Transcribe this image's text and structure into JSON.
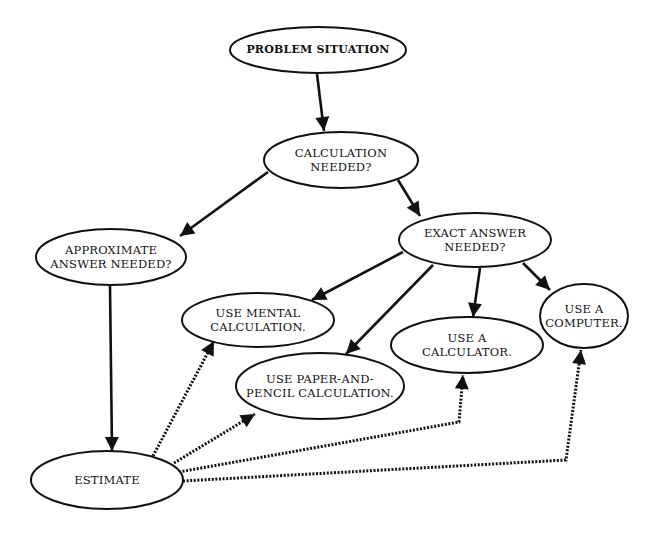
{
  "diagram": {
    "type": "flowchart",
    "nodes": [
      {
        "id": "problem",
        "lines": [
          "PROBLEM  SITUATION"
        ],
        "cx": 318,
        "cy": 50,
        "rx": 88,
        "ry": 23
      },
      {
        "id": "calc_needed",
        "lines": [
          "CALCULATION",
          "NEEDED?"
        ],
        "cx": 341,
        "cy": 160,
        "rx": 77,
        "ry": 28
      },
      {
        "id": "approx",
        "lines": [
          "APPROXIMATE",
          "ANSWER NEEDED?"
        ],
        "cx": 111,
        "cy": 257,
        "rx": 75,
        "ry": 28
      },
      {
        "id": "exact",
        "lines": [
          "EXACT ANSWER",
          "NEEDED?"
        ],
        "cx": 475,
        "cy": 240,
        "rx": 76,
        "ry": 27
      },
      {
        "id": "mental",
        "lines": [
          "USE MENTAL",
          "CALCULATION."
        ],
        "cx": 258,
        "cy": 320,
        "rx": 76,
        "ry": 27
      },
      {
        "id": "paper",
        "lines": [
          "USE PAPER-AND-",
          "PENCIL CALCULATION."
        ],
        "cx": 320,
        "cy": 386,
        "rx": 84,
        "ry": 33
      },
      {
        "id": "calculator",
        "lines": [
          "USE A",
          "CALCULATOR."
        ],
        "cx": 467,
        "cy": 345,
        "rx": 76,
        "ry": 28
      },
      {
        "id": "computer",
        "lines": [
          "USE A",
          "COMPUTER."
        ],
        "cx": 584,
        "cy": 316,
        "rx": 44,
        "ry": 32
      },
      {
        "id": "estimate",
        "lines": [
          "ESTIMATE"
        ],
        "cx": 107,
        "cy": 480,
        "rx": 76,
        "ry": 29
      }
    ],
    "edges": [
      {
        "from": "problem",
        "to": "calc_needed",
        "style": "solid",
        "points": [
          [
            317,
            74
          ],
          [
            324,
            131
          ]
        ]
      },
      {
        "from": "calc_needed",
        "to": "approx",
        "style": "solid",
        "points": [
          [
            268,
            172
          ],
          [
            180,
            236
          ]
        ]
      },
      {
        "from": "calc_needed",
        "to": "exact",
        "style": "solid",
        "points": [
          [
            398,
            180
          ],
          [
            420,
            216
          ]
        ]
      },
      {
        "from": "approx",
        "to": "estimate",
        "style": "solid",
        "points": [
          [
            110,
            286
          ],
          [
            112,
            451
          ]
        ]
      },
      {
        "from": "exact",
        "to": "mental",
        "style": "solid",
        "points": [
          [
            403,
            252
          ],
          [
            312,
            300
          ]
        ]
      },
      {
        "from": "exact",
        "to": "paper",
        "style": "solid",
        "points": [
          [
            433,
            265
          ],
          [
            346,
            354
          ]
        ]
      },
      {
        "from": "exact",
        "to": "calculator",
        "style": "solid",
        "points": [
          [
            480,
            268
          ],
          [
            473,
            317
          ]
        ]
      },
      {
        "from": "exact",
        "to": "computer",
        "style": "solid",
        "points": [
          [
            523,
            263
          ],
          [
            550,
            290
          ]
        ]
      },
      {
        "from": "estimate",
        "to": "mental",
        "style": "dotted",
        "points": [
          [
            153,
            456
          ],
          [
            214,
            341
          ]
        ]
      },
      {
        "from": "estimate",
        "to": "paper",
        "style": "dotted",
        "points": [
          [
            174,
            463
          ],
          [
            255,
            414
          ]
        ]
      },
      {
        "from": "estimate",
        "to": "calculator",
        "style": "dotted",
        "points": [
          [
            179,
            472
          ],
          [
            459,
            422
          ],
          [
            463,
            375
          ]
        ]
      },
      {
        "from": "estimate",
        "to": "computer",
        "style": "dotted",
        "points": [
          [
            183,
            481
          ],
          [
            566,
            460
          ],
          [
            581,
            350
          ]
        ]
      }
    ]
  }
}
